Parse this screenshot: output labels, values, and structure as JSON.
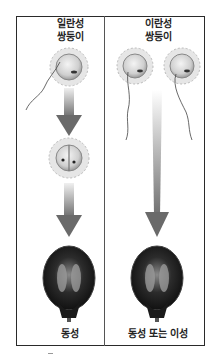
{
  "diagram": {
    "left_panel": {
      "heading_line1": "일란성",
      "heading_line2": "쌍둥이",
      "stages": [
        "one egg fertilized by one sperm",
        "zygote splits into two cells",
        "two fetuses in one placenta"
      ],
      "result_label": "동성"
    },
    "right_panel": {
      "heading_line1": "이란성",
      "heading_line2": "쌍둥이",
      "stages": [
        "two eggs each fertilized by a sperm",
        "two fetuses"
      ],
      "result_label": "동성 또는 이성"
    },
    "colors": {
      "frame": "#2a2a2a",
      "arrow_dark": "#6e6e6e",
      "arrow_light": "#eeeeee",
      "egg_fill": "#dcdcdc",
      "uterus": "#1e1e1e"
    }
  }
}
